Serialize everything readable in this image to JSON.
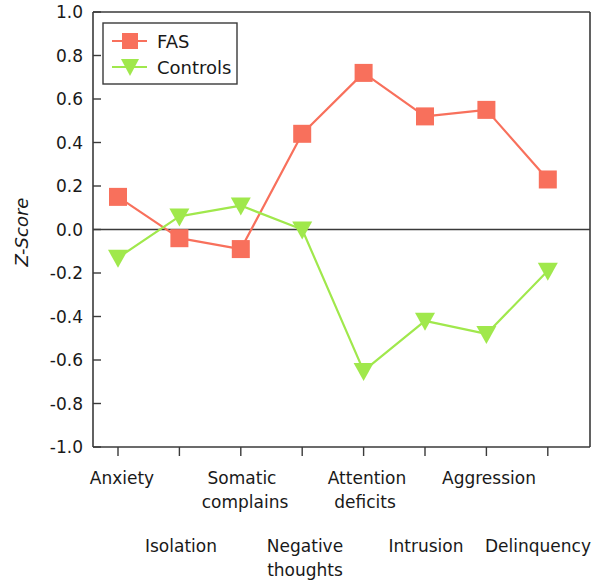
{
  "chart_data": {
    "type": "line",
    "title": "",
    "xlabel": "",
    "ylabel": "Z-Score",
    "ylim": [
      -1.0,
      1.0
    ],
    "ytick_labels": [
      "1.0",
      "0.8",
      "0.6",
      "0.4",
      "0.2",
      "0.0",
      "-0.2",
      "-0.4",
      "-0.6",
      "-0.8",
      "-1.0"
    ],
    "ytick_values": [
      1.0,
      0.8,
      0.6,
      0.4,
      0.2,
      0.0,
      -0.2,
      -0.4,
      -0.6,
      -0.8,
      -1.0
    ],
    "grid": false,
    "zero_line": true,
    "legend_position": "top-left",
    "categories": [
      "Anxiety",
      "Isolation",
      "Somatic complains",
      "Negative thoughts",
      "Attention deficits",
      "Intrusion",
      "Aggression",
      "Delinquency"
    ],
    "series": [
      {
        "name": "FAS",
        "color": "#F8705C",
        "marker": "square",
        "values": [
          0.15,
          -0.04,
          -0.09,
          0.44,
          0.72,
          0.52,
          0.55,
          0.23
        ]
      },
      {
        "name": "Controls",
        "color": "#A0E84C",
        "marker": "triangle-down",
        "values": [
          -0.13,
          0.06,
          0.11,
          0.0,
          -0.65,
          -0.42,
          -0.48,
          -0.19
        ]
      }
    ]
  },
  "xaxis": {
    "row_top": [
      {
        "text": "Anxiety",
        "index": 0
      },
      {
        "text": "Somatic",
        "index": 2
      },
      {
        "text": "complains",
        "index": 2
      },
      {
        "text": "Attention",
        "index": 4
      },
      {
        "text": "deficits",
        "index": 4
      },
      {
        "text": "Aggression",
        "index": 6
      }
    ],
    "row_bottom": [
      {
        "text": "Isolation",
        "index": 1
      },
      {
        "text": "Negative",
        "index": 3
      },
      {
        "text": "thoughts",
        "index": 3
      },
      {
        "text": "Intrusion",
        "index": 5
      },
      {
        "text": "Delinquency",
        "index": 7
      }
    ],
    "labels": {
      "anxiety": "Anxiety",
      "isolation": "Isolation",
      "somatic_line1": "Somatic",
      "somatic_line2": "complains",
      "negative_line1": "Negative",
      "negative_line2": "thoughts",
      "attention_line1": "Attention",
      "attention_line2": "deficits",
      "intrusion": "Intrusion",
      "aggression": "Aggression",
      "delinquency": "Delinquency"
    }
  },
  "yaxis": {
    "title": "Z-Score",
    "ticks": [
      "1.0",
      "0.8",
      "0.6",
      "0.4",
      "0.2",
      "0.0",
      "-0.2",
      "-0.4",
      "-0.6",
      "-0.8",
      "-1.0"
    ]
  },
  "legend": {
    "entries": [
      {
        "label": "FAS",
        "color": "#F8705C",
        "marker": "square"
      },
      {
        "label": "Controls",
        "color": "#A0E84C",
        "marker": "triangle-down"
      }
    ]
  }
}
